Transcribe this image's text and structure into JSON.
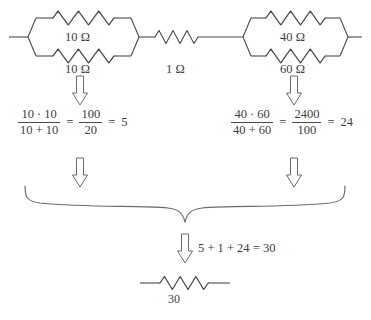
{
  "diagram": {
    "stroke_color": "#4a4a4a",
    "text_color": "#3d3d3d",
    "background": "#ffffff",
    "ohm_symbol": "Ω"
  },
  "circuit": {
    "left_parallel_block": {
      "name": "left-parallel-pair",
      "top_resistor_label": "10 Ω",
      "bottom_resistor_label": "10 Ω"
    },
    "series_resistor": {
      "name": "series-resistor",
      "label": "1 Ω"
    },
    "right_parallel_block": {
      "name": "right-parallel-pair",
      "top_resistor_label": "40 Ω",
      "bottom_resistor_label": "60 Ω"
    }
  },
  "equations": {
    "left": {
      "numerator": "10 · 10",
      "denominator": "10 + 10",
      "equals_1": "=",
      "second_numerator": "100",
      "second_denominator": "20",
      "equals_2": "=",
      "result": "5"
    },
    "right": {
      "numerator": "40 · 60",
      "denominator": "40 + 60",
      "equals_1": "=",
      "second_numerator": "2400",
      "second_denominator": "100",
      "equals_2": "=",
      "result": "24"
    },
    "total": "5 + 1 + 24 = 30"
  },
  "result": {
    "equivalent_resistor_label": "30"
  },
  "arrows": [
    {
      "name": "arrow-left-block-down",
      "direction": "down"
    },
    {
      "name": "arrow-right-block-down",
      "direction": "down"
    },
    {
      "name": "arrow-left-equation-down",
      "direction": "down"
    },
    {
      "name": "arrow-right-equation-down",
      "direction": "down"
    },
    {
      "name": "arrow-total-down",
      "direction": "down"
    }
  ]
}
